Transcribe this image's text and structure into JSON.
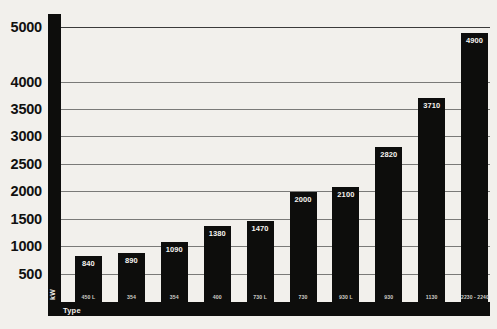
{
  "chart_data": {
    "type": "bar",
    "title": "",
    "xlabel": "Type",
    "ylabel": "kW",
    "ylim": [
      0,
      5250
    ],
    "grid": true,
    "legend": null,
    "yticks": [
      500,
      1000,
      1500,
      2000,
      2500,
      3000,
      3500,
      4000,
      5000
    ],
    "ytick_labels": [
      "500",
      "1000",
      "1500",
      "2000",
      "2500",
      "3000",
      "3500",
      "4000",
      "5000"
    ],
    "categories": [
      "450 L",
      "354",
      "354",
      "400",
      "730 L",
      "730",
      "930 L",
      "930",
      "1130",
      "2230 - 2240"
    ],
    "values": [
      840,
      890,
      1090,
      1380,
      1470,
      2000,
      2100,
      2820,
      3710,
      4900
    ],
    "value_labels": [
      "840",
      "890",
      "1090",
      "1380",
      "1470",
      "2000",
      "2100",
      "2820",
      "3710",
      "4900"
    ]
  },
  "axis": {
    "y_unit": "kW",
    "x_unit": "Type"
  },
  "colors": {
    "background": "#f2f0ec",
    "bar": "#0d0d0c",
    "gridline": "#7a7a78",
    "label_on_bar": "#f5f3ef",
    "tick_text": "#111110"
  }
}
